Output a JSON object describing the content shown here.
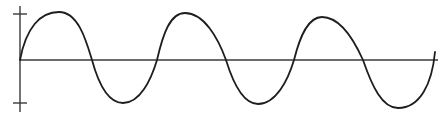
{
  "chart_data": {
    "type": "line",
    "title": "",
    "xlabel": "",
    "ylabel": "",
    "grid": false,
    "legend": null,
    "yticks": [
      "+A",
      "-A"
    ],
    "ylim": [
      -1.1,
      1.1
    ],
    "xlim": [
      0,
      3
    ],
    "series": [
      {
        "name": "waveform",
        "color": "#1e1e1e",
        "x": [
          0,
          0.25,
          0.5,
          0.75,
          1.0,
          1.25,
          1.5,
          1.75,
          2.0,
          2.25,
          2.5,
          2.75,
          3.0
        ],
        "values": [
          0,
          1.0,
          0,
          -0.95,
          0,
          1.0,
          0,
          -0.95,
          0,
          0.9,
          0,
          -1.05,
          0
        ]
      }
    ]
  },
  "geometry": {
    "axis_color": "#3a3a3a",
    "wave_color": "#1e1e1e",
    "y_axis_x": 20,
    "y_axis_top": 6,
    "y_axis_bottom": 112,
    "zero_y": 60,
    "x_axis_end": 438,
    "tick_top_y": 14,
    "tick_bottom_y": 103,
    "tick_half_width": 7,
    "wave_path": "M20,60 C26,28 40,12 59,12 C78,12 86,40 92,60 C98,82 108,103 123,103 C140,103 151,80 157,60 C163,34 170,13 185,13 C204,13 218,38 226,60 C234,86 244,104 258,104 C276,104 288,80 294,60 C300,36 308,17 322,17 C340,17 354,40 363,60 C372,86 382,108 398,108 C420,108 432,84 435,52"
  }
}
